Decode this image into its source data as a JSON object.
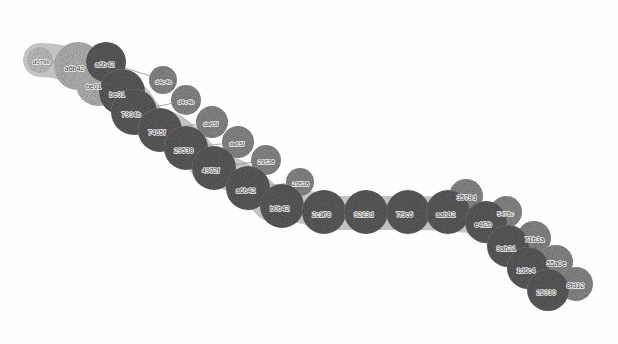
{
  "view": {
    "title": "chain-graph",
    "width": 618,
    "height": 344,
    "background": "#ffffff"
  },
  "legend_colors": {
    "backbone_node": "#5f5f5f",
    "backdrop_node": "#b9b9b9",
    "branch_node": "#8d8d8d",
    "terminal_node": "#c6c6c6",
    "edge": "#9a9a9a",
    "label_text": "#3a3a3a"
  },
  "chart_data": {
    "type": "scatter",
    "title": "",
    "xlabel": "",
    "ylabel": "",
    "layout": "node-link chain, left-to-right descending backbone with upward branch stubs",
    "nodes": [
      {
        "id": "d079b",
        "label": "d079b",
        "x": 40,
        "y": 60,
        "r": 13,
        "role": "terminal",
        "color": "#c6c6c6"
      },
      {
        "id": "a6b42",
        "label": "a6b42",
        "x": 78,
        "y": 66,
        "r": 24,
        "role": "backdrop",
        "color": "#b9b9b9"
      },
      {
        "id": "a6b42b",
        "label": "a6b42",
        "x": 106,
        "y": 62,
        "r": 20,
        "role": "backbone",
        "color": "#5f5f5f"
      },
      {
        "id": "be01",
        "label": "be01",
        "x": 98,
        "y": 84,
        "r": 22,
        "role": "backdrop",
        "color": "#b9b9b9"
      },
      {
        "id": "be01b",
        "label": "be01",
        "x": 122,
        "y": 92,
        "r": 23,
        "role": "backbone",
        "color": "#5f5f5f"
      },
      {
        "id": "7904b",
        "label": "7904b",
        "x": 134,
        "y": 112,
        "r": 23,
        "role": "backbone",
        "color": "#5f5f5f"
      },
      {
        "id": "d4c4b",
        "label": "d4c4b",
        "x": 163,
        "y": 80,
        "r": 14,
        "role": "branch",
        "color": "#8d8d8d"
      },
      {
        "id": "d4c4b2",
        "label": "d4c4b",
        "x": 186,
        "y": 100,
        "r": 15,
        "role": "branch",
        "color": "#8d8d8d"
      },
      {
        "id": "7465f",
        "label": "7465f",
        "x": 160,
        "y": 130,
        "r": 22,
        "role": "backbone",
        "color": "#5f5f5f"
      },
      {
        "id": "da65f",
        "label": "da65f",
        "x": 212,
        "y": 122,
        "r": 16,
        "role": "branch",
        "color": "#8d8d8d"
      },
      {
        "id": "29538",
        "label": "29538",
        "x": 186,
        "y": 148,
        "r": 22,
        "role": "backbone",
        "color": "#5f5f5f"
      },
      {
        "id": "da65f2",
        "label": "da65f",
        "x": 238,
        "y": 142,
        "r": 16,
        "role": "branch",
        "color": "#8d8d8d"
      },
      {
        "id": "4972f",
        "label": "4972f",
        "x": 214,
        "y": 168,
        "r": 22,
        "role": "backbone",
        "color": "#5f5f5f"
      },
      {
        "id": "29538b",
        "label": "29538",
        "x": 266,
        "y": 160,
        "r": 15,
        "role": "branch",
        "color": "#8d8d8d"
      },
      {
        "id": "a6b42c",
        "label": "a6b42",
        "x": 248,
        "y": 188,
        "r": 22,
        "role": "backbone",
        "color": "#5f5f5f"
      },
      {
        "id": "29538c",
        "label": "29538",
        "x": 300,
        "y": 182,
        "r": 14,
        "role": "branch",
        "color": "#8d8d8d"
      },
      {
        "id": "b0b42",
        "label": "b0b42",
        "x": 282,
        "y": 206,
        "r": 22,
        "role": "backbone",
        "color": "#5f5f5f"
      },
      {
        "id": "2c178",
        "label": "2c178",
        "x": 324,
        "y": 212,
        "r": 22,
        "role": "backbone",
        "color": "#5f5f5f"
      },
      {
        "id": "9213d",
        "label": "9213d",
        "x": 366,
        "y": 212,
        "r": 22,
        "role": "backbone",
        "color": "#5f5f5f"
      },
      {
        "id": "7f9c6",
        "label": "7f9c6",
        "x": 408,
        "y": 212,
        "r": 22,
        "role": "backbone",
        "color": "#5f5f5f"
      },
      {
        "id": "aab82",
        "label": "aab82",
        "x": 448,
        "y": 212,
        "r": 22,
        "role": "backbone",
        "color": "#5f5f5f"
      },
      {
        "id": "3579d",
        "label": "3579d",
        "x": 466,
        "y": 196,
        "r": 17,
        "role": "branch",
        "color": "#8d8d8d"
      },
      {
        "id": "e4f2b",
        "label": "e4f2b",
        "x": 486,
        "y": 222,
        "r": 21,
        "role": "backbone",
        "color": "#5f5f5f"
      },
      {
        "id": "5478c",
        "label": "5478c",
        "x": 506,
        "y": 212,
        "r": 16,
        "role": "branch",
        "color": "#8d8d8d"
      },
      {
        "id": "9ab21",
        "label": "9ab21",
        "x": 508,
        "y": 246,
        "r": 21,
        "role": "backbone",
        "color": "#5f5f5f"
      },
      {
        "id": "71b3a",
        "label": "71b3a",
        "x": 534,
        "y": 238,
        "r": 17,
        "role": "branch",
        "color": "#8d8d8d"
      },
      {
        "id": "1d6c4",
        "label": "1d6c4",
        "x": 528,
        "y": 268,
        "r": 21,
        "role": "backbone",
        "color": "#5f5f5f"
      },
      {
        "id": "55a0e",
        "label": "55a0e",
        "x": 556,
        "y": 262,
        "r": 17,
        "role": "branch",
        "color": "#8d8d8d"
      },
      {
        "id": "26030",
        "label": "26030",
        "x": 548,
        "y": 290,
        "r": 21,
        "role": "backbone",
        "color": "#5f5f5f"
      },
      {
        "id": "8fd12",
        "label": "8fd12",
        "x": 576,
        "y": 284,
        "r": 17,
        "role": "branch",
        "color": "#8d8d8d"
      }
    ],
    "edges": [
      {
        "from": "d079b",
        "to": "a6b42"
      },
      {
        "from": "a6b42",
        "to": "a6b42b"
      },
      {
        "from": "a6b42",
        "to": "be01"
      },
      {
        "from": "be01",
        "to": "be01b"
      },
      {
        "from": "be01b",
        "to": "7904b"
      },
      {
        "from": "a6b42b",
        "to": "d4c4b"
      },
      {
        "from": "7904b",
        "to": "7465f"
      },
      {
        "from": "7904b",
        "to": "d4c4b2"
      },
      {
        "from": "7465f",
        "to": "29538"
      },
      {
        "from": "7465f",
        "to": "da65f"
      },
      {
        "from": "29538",
        "to": "4972f"
      },
      {
        "from": "29538",
        "to": "da65f2"
      },
      {
        "from": "4972f",
        "to": "a6b42c"
      },
      {
        "from": "4972f",
        "to": "29538b"
      },
      {
        "from": "a6b42c",
        "to": "b0b42"
      },
      {
        "from": "a6b42c",
        "to": "29538c"
      },
      {
        "from": "b0b42",
        "to": "2c178"
      },
      {
        "from": "2c178",
        "to": "9213d"
      },
      {
        "from": "9213d",
        "to": "7f9c6"
      },
      {
        "from": "7f9c6",
        "to": "aab82"
      },
      {
        "from": "aab82",
        "to": "3579d"
      },
      {
        "from": "aab82",
        "to": "e4f2b"
      },
      {
        "from": "e4f2b",
        "to": "5478c"
      },
      {
        "from": "e4f2b",
        "to": "9ab21"
      },
      {
        "from": "9ab21",
        "to": "71b3a"
      },
      {
        "from": "9ab21",
        "to": "1d6c4"
      },
      {
        "from": "1d6c4",
        "to": "55a0e"
      },
      {
        "from": "1d6c4",
        "to": "26030"
      },
      {
        "from": "26030",
        "to": "8fd12"
      }
    ],
    "backdrop_path": [
      {
        "x": 40,
        "y": 60
      },
      {
        "x": 100,
        "y": 78
      },
      {
        "x": 150,
        "y": 124
      },
      {
        "x": 210,
        "y": 170
      },
      {
        "x": 270,
        "y": 204
      },
      {
        "x": 330,
        "y": 213
      },
      {
        "x": 420,
        "y": 213
      },
      {
        "x": 470,
        "y": 216
      },
      {
        "x": 510,
        "y": 248
      },
      {
        "x": 550,
        "y": 292
      }
    ]
  }
}
